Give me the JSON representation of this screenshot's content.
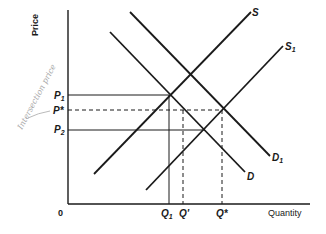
{
  "diagram": {
    "type": "supply-demand",
    "axes": {
      "y_label": "Price",
      "x_label": "Quantity",
      "origin_label": "0"
    },
    "curves": [
      {
        "id": "S",
        "label": "S",
        "sub": "",
        "kind": "supply"
      },
      {
        "id": "S1",
        "label": "S",
        "sub": "1",
        "kind": "supply"
      },
      {
        "id": "D",
        "label": "D",
        "sub": "",
        "kind": "demand"
      },
      {
        "id": "D1",
        "label": "D",
        "sub": "1",
        "kind": "demand"
      }
    ],
    "price_labels": [
      {
        "id": "P1",
        "label": "P",
        "sub": "1",
        "line": "solid"
      },
      {
        "id": "Pstar",
        "label": "P*",
        "sub": "",
        "line": "dashed"
      },
      {
        "id": "P2",
        "label": "P",
        "sub": "2",
        "line": "solid"
      }
    ],
    "quantity_labels": [
      {
        "id": "Q1",
        "label": "Q",
        "sub": "1",
        "line": "solid"
      },
      {
        "id": "Qprime",
        "label": "Q'",
        "sub": "",
        "line": "dashed"
      },
      {
        "id": "Qstar",
        "label": "Q*",
        "sub": "",
        "line": "dashed"
      }
    ],
    "annotation": {
      "handwritten": "Intersection price"
    },
    "colors": {
      "ink": "#1a1a1a",
      "pencil": "#a8a8a8",
      "background": "#ffffff"
    }
  }
}
